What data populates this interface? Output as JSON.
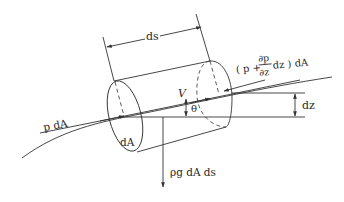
{
  "figure": {
    "type": "fluid-element-free-body-diagram"
  },
  "labels": {
    "length": "ds",
    "upstream_force": "p dA",
    "downstream_force_open": "( p + ",
    "partial_num": "∂p",
    "partial_den": "∂z",
    "downstream_force_close": " dz ) dA",
    "velocity": "V",
    "angle": "θ",
    "elevation": "dz",
    "area": "dA",
    "weight": "ρg dA ds"
  },
  "colors": {
    "line": "#333333",
    "text": "#2a2a2a",
    "background": "#ffffff"
  }
}
